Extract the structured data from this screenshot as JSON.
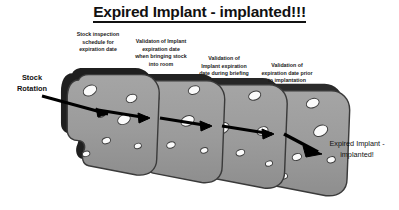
{
  "title": "Expired Implant - implanted!!!",
  "diagram": {
    "kind": "swiss-cheese-model",
    "input_label": "Stock\nRotation",
    "input_label_line1": "Stock",
    "input_label_line2": "Rotation",
    "output_label_line1": "Expired Implant -",
    "output_label_line2": "implanted!",
    "barriers": [
      {
        "index": 1,
        "label": "Stock inspection schedule for expiration date",
        "label_lines": [
          "Stock inspection",
          "schedule for",
          "expiration date"
        ]
      },
      {
        "index": 2,
        "label": "Validaton of Implant expiration date when bringing stock into room",
        "label_lines": [
          "Validaton of Implant",
          "expiration date",
          "when bringing stock",
          "into room"
        ]
      },
      {
        "index": 3,
        "label": "Validation of Implant expiration date during briefing",
        "label_lines": [
          "Validation of",
          "Implant expiration",
          "date during briefing"
        ]
      },
      {
        "index": 4,
        "label": "Validation of expiration date prior to implantation",
        "label_lines": [
          "Validation of",
          "expiration date prior",
          "to implantation"
        ]
      }
    ]
  },
  "colors": {
    "background": "#ffffff",
    "text": "#111111",
    "cheese_face": "#9a9a9a",
    "cheese_face_light": "#a8a8a8",
    "cheese_edge": "#2a2a2a",
    "cheese_hole": "#fbfbfb",
    "arrow": "#000000"
  }
}
